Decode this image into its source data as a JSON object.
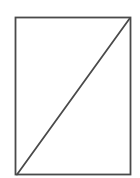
{
  "diagram": {
    "type": "geometry",
    "background": "#ffffff",
    "stroke_color": "#4a4a4a",
    "stroke_width": 1.8,
    "shapes": [
      {
        "kind": "rectangle",
        "name": "rectangle",
        "x": 15.5,
        "y": 17.5,
        "width": 115,
        "height": 157
      },
      {
        "kind": "line",
        "name": "diagonal",
        "x1": 17,
        "y1": 174.5,
        "x2": 130,
        "y2": 18
      }
    ],
    "labels": []
  }
}
